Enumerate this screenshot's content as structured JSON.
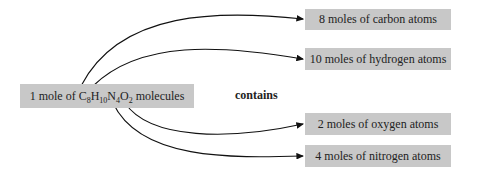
{
  "source": {
    "prefix": "1 mole of ",
    "formula": [
      {
        "el": "C",
        "n": "8"
      },
      {
        "el": "H",
        "n": "10"
      },
      {
        "el": "N",
        "n": "4"
      },
      {
        "el": "O",
        "n": "2"
      }
    ],
    "suffix": " molecules"
  },
  "relation": "contains",
  "targets": [
    {
      "label": "8 moles of carbon atoms"
    },
    {
      "label": "10 moles of hydrogen atoms"
    },
    {
      "label": "2 moles of oxygen atoms"
    },
    {
      "label": "4 moles of nitrogen atoms"
    }
  ],
  "colors": {
    "box": "#c8c8c8",
    "line": "#111111"
  }
}
